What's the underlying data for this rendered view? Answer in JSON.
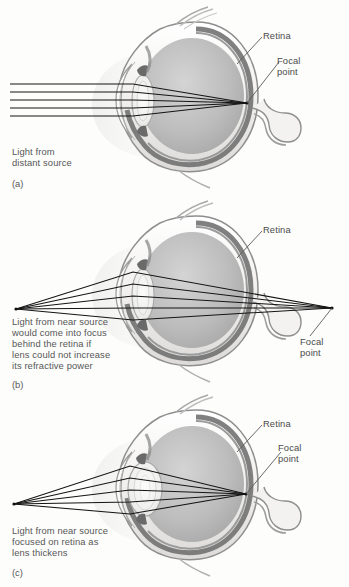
{
  "figure": {
    "background_color": "#fdfdfc",
    "ink_color": "#4a4a4a",
    "ray_color": "#1a1a1a",
    "sclera_color": "#f2f1ef",
    "vitreous_color": "#b9b9b9",
    "retina_color": "#6e6e6e",
    "lens_color": "#e8e8e6"
  },
  "panels": [
    {
      "id": "a",
      "marker": "(a)",
      "caption_lines": [
        "Light from",
        "distant source"
      ],
      "labels": [
        {
          "name": "retina",
          "text": "Retina"
        },
        {
          "name": "focal-point",
          "text": "Focal\npoint"
        }
      ],
      "ray_type": "parallel",
      "ray_count": 5,
      "focal_location": "on-retina",
      "lens_shape": "flat",
      "description": "Parallel rays from a distant source are refracted by the cornea and lens and converge at the retina."
    },
    {
      "id": "b",
      "marker": "(b)",
      "caption_lines": [
        "Light from near source",
        "would come into focus",
        "behind the retina if",
        "lens could not increase",
        "its refractive power"
      ],
      "labels": [
        {
          "name": "retina",
          "text": "Retina"
        },
        {
          "name": "focal-point",
          "text": "Focal\npoint"
        }
      ],
      "ray_type": "divergent",
      "ray_count": 5,
      "focal_location": "behind-retina",
      "lens_shape": "flat",
      "description": "Divergent rays from a near source pass through an unaccommodated lens and converge behind the retina."
    },
    {
      "id": "c",
      "marker": "(c)",
      "caption_lines": [
        "Light from near source",
        "focused on retina as",
        "lens thickens"
      ],
      "labels": [
        {
          "name": "retina",
          "text": "Retina"
        },
        {
          "name": "focal-point",
          "text": "Focal\npoint"
        }
      ],
      "ray_type": "divergent",
      "ray_count": 5,
      "focal_location": "on-retina",
      "lens_shape": "thick",
      "description": "With the lens thickened by accommodation, divergent rays from a near source converge on the retina."
    }
  ]
}
